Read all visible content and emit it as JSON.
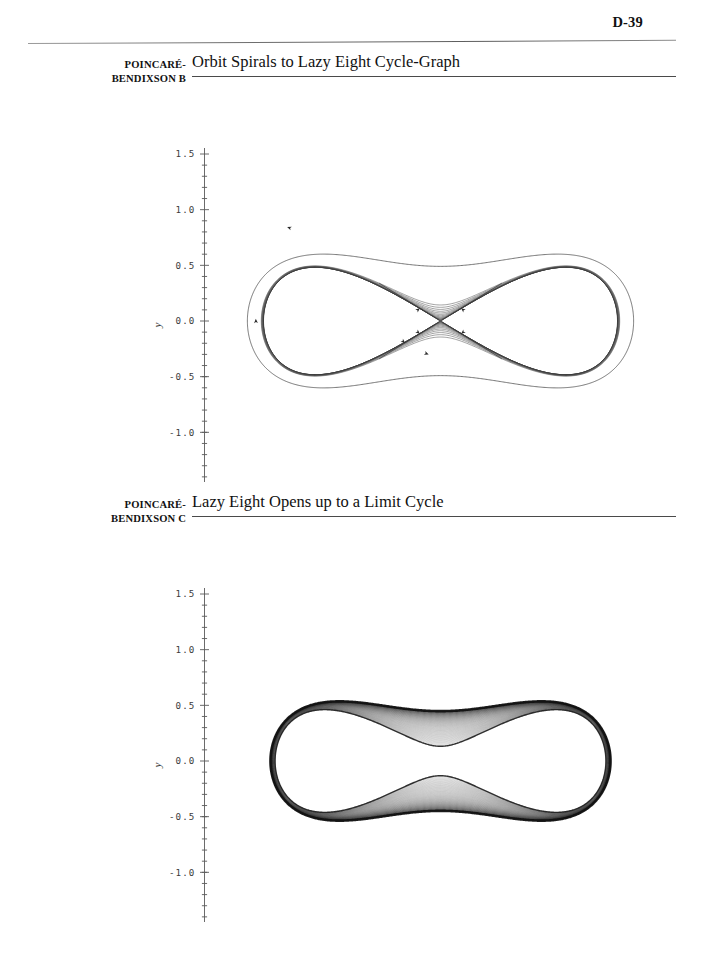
{
  "page": {
    "number": "D-39"
  },
  "figures": [
    {
      "id": "poincare-bendixson-b",
      "marginal_label_line1": "POINCARÉ-",
      "marginal_label_line2": "BENDIXSON B",
      "title": "Orbit Spirals to Lazy Eight Cycle-Graph",
      "chart_data": {
        "type": "line",
        "title": "Orbit Spirals to Lazy Eight Cycle-Graph",
        "xlabel": "x",
        "ylabel": "y",
        "xlim": [
          -2,
          2
        ],
        "ylim": [
          -1.5,
          1.5
        ],
        "xticks": [
          -2,
          -1,
          0,
          1,
          2
        ],
        "yticks": [
          1.5,
          1.0,
          0.5,
          0.0,
          -0.5,
          -1.0,
          -1.5
        ],
        "xtick_labels": [
          "-2",
          "-1",
          "0",
          "1",
          "2"
        ],
        "ytick_labels": [
          "1.5",
          "1.0",
          "0.5",
          "0.0",
          "-0.5",
          "-1.0",
          "-1.5"
        ],
        "minor_ticks_per_interval": 5,
        "grid": false,
        "legend": "none",
        "description": "Phase portrait: a single trajectory starting on an outer closed loop spirals inward and accumulates on a lazy-eight (figure-eight) cycle-graph formed by two homoclinic loops joined at a saddle equilibrium at the origin.",
        "equilibrium_points": [
          {
            "x": 0.0,
            "y": 0.0,
            "type": "saddle"
          }
        ],
        "separatrix_arrow_count": 6,
        "outer_orbit_extent": {
          "x_min": -1.62,
          "x_max": 1.62,
          "y_min": -1.07,
          "y_max": 1.07
        },
        "cycle_graph_extent": {
          "x_min": -1.5,
          "x_max": 1.5,
          "y_min": -0.97,
          "y_max": 0.97
        },
        "lobe_centers": [
          {
            "x": -0.95,
            "y": 0.0
          },
          {
            "x": 0.95,
            "y": 0.0
          }
        ],
        "spiral_turn_count": 14,
        "series": [
          {
            "name": "outer orbit",
            "role": "transient",
            "values": "parametric lazy-eight family, scale 1.08"
          },
          {
            "name": "inward spiral",
            "role": "accumulating",
            "values": "14 nested lazy-eight level curves, scales 1.06 to 1.001"
          },
          {
            "name": "lazy eight cycle-graph",
            "role": "limit set",
            "values": "homoclinic double loop through saddle (0,0)"
          }
        ]
      }
    },
    {
      "id": "poincare-bendixson-c",
      "marginal_label_line1": "POINCARÉ-",
      "marginal_label_line2": "BENDIXSON C",
      "title": "Lazy Eight Opens up to a Limit Cycle",
      "chart_data": {
        "type": "line",
        "title": "Lazy Eight Opens up to a Limit Cycle",
        "xlabel": "x",
        "ylabel": "y",
        "xlim": [
          -2,
          2
        ],
        "ylim": [
          -1.5,
          1.5
        ],
        "xticks": [
          -2,
          -1,
          0,
          1,
          2
        ],
        "yticks": [
          1.5,
          1.0,
          0.5,
          0.0,
          -0.5,
          -1.0,
          -1.5
        ],
        "xtick_labels": [
          "-2",
          "-1",
          "0",
          "1",
          "2"
        ],
        "ytick_labels": [
          "1.5",
          "1.0",
          "0.5",
          "0.0",
          "-0.5",
          "-1.0",
          "-1.5"
        ],
        "minor_ticks_per_interval": 5,
        "grid": false,
        "legend": "none",
        "description": "Phase portrait: the lazy-eight cycle-graph has broken open, and the orbit fills a dense annular band that winds outward and converges onto a single heavy closed limit cycle surrounding both lobes.",
        "equilibrium_points": [],
        "outer_limit_cycle_extent": {
          "x_min": -1.55,
          "x_max": 1.55,
          "y_min": -1.06,
          "y_max": 1.06
        },
        "inner_boundary_extent": {
          "x_min": -1.28,
          "x_max": 1.28,
          "y_min": -0.88,
          "y_max": 0.88
        },
        "waist_y_upper": 0.14,
        "waist_y_lower": -0.14,
        "orbit_turn_count": 60,
        "series": [
          {
            "name": "dense winding orbit",
            "role": "transient",
            "values": "60 nested lazy-eight level curves sweeping from the inner boundary outward"
          },
          {
            "name": "limit cycle",
            "role": "attractor",
            "values": "single heavy closed curve, outermost boundary of the band"
          }
        ]
      }
    }
  ]
}
